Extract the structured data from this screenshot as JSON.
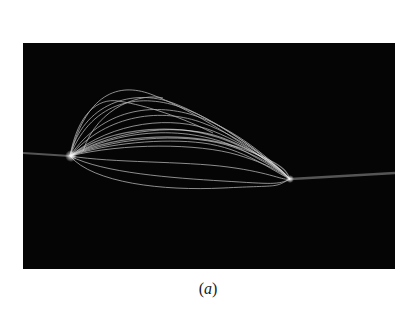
{
  "figure": {
    "panel_label_open": "(",
    "panel_label_letter": "a",
    "panel_label_close": ")",
    "image_description": "Long-exposure photograph of white filament/trajectory traces forming an elongated bundle on black background, with a faint horizontal line passing through",
    "colors": {
      "background": "#050505",
      "traces": "#f0f0f0",
      "page": "#ffffff"
    }
  }
}
